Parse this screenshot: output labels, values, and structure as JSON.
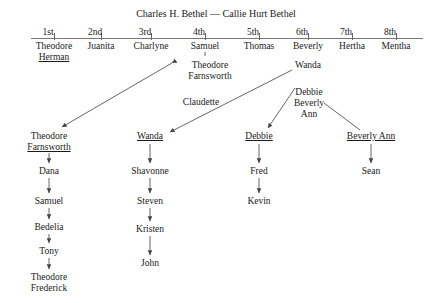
{
  "diagram": {
    "title": "Charles H. Bethel — Callie Hurt Bethel",
    "ordinals": [
      "1st",
      "2nd",
      "3rd",
      "4th",
      "5th",
      "6th",
      "7th",
      "8th"
    ],
    "children": [
      {
        "lines": [
          "Theodore",
          "Herman"
        ],
        "underlined": [
          false,
          true
        ]
      },
      {
        "lines": [
          "Juanita"
        ],
        "underlined": [
          false
        ]
      },
      {
        "lines": [
          "Charlyne"
        ],
        "underlined": [
          false
        ]
      },
      {
        "lines": [
          "Samuel"
        ],
        "underlined": [
          false
        ]
      },
      {
        "lines": [
          "Thomas"
        ],
        "underlined": [
          false
        ]
      },
      {
        "lines": [
          "Beverly"
        ],
        "underlined": [
          false
        ]
      },
      {
        "lines": [
          "Hertha"
        ],
        "underlined": [
          false
        ]
      },
      {
        "lines": [
          "Mentha"
        ],
        "underlined": [
          false
        ]
      }
    ],
    "mid_labels": [
      {
        "lines": [
          "Theodore",
          "Farnsworth"
        ],
        "underlined": [
          false,
          false
        ]
      },
      {
        "lines": [
          "Wanda"
        ],
        "underlined": [
          false
        ]
      },
      {
        "lines": [
          "Claudette"
        ],
        "underlined": [
          false
        ]
      },
      {
        "lines": [
          "Debbie",
          "Beverly",
          "Ann"
        ],
        "underlined": [
          false,
          false,
          false
        ]
      }
    ],
    "lineage_roots": [
      {
        "lines": [
          "Theodore",
          "Farnsworth"
        ],
        "underlined": [
          false,
          true
        ]
      },
      {
        "lines": [
          "Wanda"
        ],
        "underlined": [
          true
        ]
      },
      {
        "lines": [
          "Debbie"
        ],
        "underlined": [
          true
        ]
      },
      {
        "lines": [
          "Beverly Ann"
        ],
        "underlined": [
          true
        ]
      }
    ],
    "descendants": {
      "theodore_farnsworth": [
        "Dana",
        "Samuel",
        "Bedelia",
        "Tony",
        "Theodore Frederick"
      ],
      "wanda": [
        "Shavonne",
        "Steven",
        "Kristen",
        "John"
      ],
      "debbie": [
        "Fred",
        "Kevin"
      ],
      "beverly_ann": [
        "Sean"
      ]
    },
    "descendant_nodes": [
      {
        "lines": [
          "Dana"
        ],
        "underlined": [
          false
        ]
      },
      {
        "lines": [
          "Samuel"
        ],
        "underlined": [
          false
        ]
      },
      {
        "lines": [
          "Bedelia"
        ],
        "underlined": [
          false
        ]
      },
      {
        "lines": [
          "Tony"
        ],
        "underlined": [
          false
        ]
      },
      {
        "lines": [
          "Theodore",
          "Frederick"
        ],
        "underlined": [
          false,
          false
        ]
      },
      {
        "lines": [
          "Shavonne"
        ],
        "underlined": [
          false
        ]
      },
      {
        "lines": [
          "Steven"
        ],
        "underlined": [
          false
        ]
      },
      {
        "lines": [
          "Kristen"
        ],
        "underlined": [
          false
        ]
      },
      {
        "lines": [
          "John"
        ],
        "underlined": [
          false
        ]
      },
      {
        "lines": [
          "Fred"
        ],
        "underlined": [
          false
        ]
      },
      {
        "lines": [
          "Kevin"
        ],
        "underlined": [
          false
        ]
      },
      {
        "lines": [
          "Sean"
        ],
        "underlined": [
          false
        ]
      }
    ],
    "colors": {
      "text": "#1a1a1a",
      "rule": "#777777",
      "connector": "#555555",
      "background": "#ffffff"
    }
  }
}
